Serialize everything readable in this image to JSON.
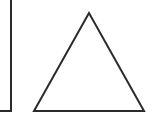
{
  "diagram": {
    "background": "#ffffff",
    "stroke_color": "#2b2b2b",
    "shapes": [
      {
        "type": "rectangle-partial",
        "name": "square",
        "x": -20,
        "y": -2,
        "right": 11,
        "bottom": 111
      },
      {
        "type": "triangle",
        "name": "triangle",
        "points": [
          [
            89,
            13
          ],
          [
            34,
            111
          ],
          [
            144,
            111
          ]
        ]
      }
    ]
  }
}
